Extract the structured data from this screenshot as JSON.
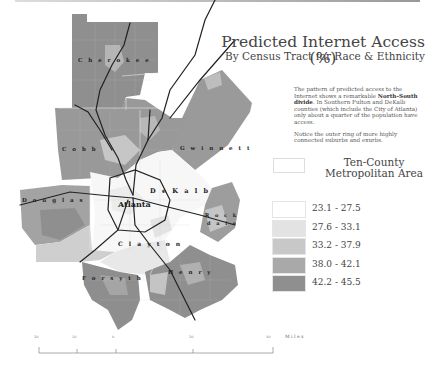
{
  "header": {
    "title": "Predicted Internet Access (%)",
    "subtitle": "By Census Tract for Race & Ethnicity"
  },
  "description": {
    "paragraph1_pre": "The pattern of predicted access to the Internet shows a remarkable ",
    "paragraph1_bold": "North–South divide",
    "paragraph1_post": ". In Southern Fulton and DeKalb counties (which include the City of Atlanta) only about a quarter of the population have access.",
    "paragraph2": "Notice the outer ring of more highly connected suburbs and exurbs."
  },
  "metro_legend": {
    "line1": "Ten-County",
    "line2": "Metropolitan Area"
  },
  "legend": {
    "items": [
      {
        "label": "23.1 - 27.5",
        "color": "#ffffff"
      },
      {
        "label": "27.6 - 33.1",
        "color": "#e3e3e3"
      },
      {
        "label": "33.2 - 37.9",
        "color": "#c8c8c8"
      },
      {
        "label": "38.0 - 42.1",
        "color": "#a9a9a9"
      },
      {
        "label": "42.2 - 45.5",
        "color": "#8f8f8f"
      }
    ]
  },
  "map": {
    "counties": [
      "Cherokee",
      "Cobb",
      "Gwinnett",
      "Douglas",
      "Atlanta",
      "DeKalb",
      "Rockdale",
      "Clayton",
      "Fayette",
      "Henry"
    ],
    "county_labels": {
      "cherokee": "C h e r o k e e",
      "cobb": "C o b b",
      "gwinnett": "G w i n n e t t",
      "douglas": "D o u g l a s",
      "atlanta": "Atlanta",
      "dekalb": "D e K a l b",
      "rock": "R o c k",
      "dale": "d a l e",
      "clayton": "C l a y t o n",
      "forsyth": "F o r s y t h",
      "henry": "H e n r y"
    }
  },
  "scale_bar": {
    "ticks": [
      "20",
      "10",
      "0",
      "20",
      "40"
    ],
    "unit": "Miles"
  }
}
